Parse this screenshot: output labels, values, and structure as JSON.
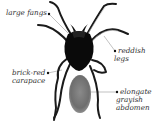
{
  "figure": {
    "labels": [
      {
        "id": "fangs",
        "lines": [
          "large fangs"
        ]
      },
      {
        "id": "legs",
        "lines": [
          "reddish",
          "legs"
        ]
      },
      {
        "id": "carapace",
        "lines": [
          "brick-red",
          "carapace"
        ]
      },
      {
        "id": "abdomen",
        "lines": [
          "elongate",
          "grayish",
          "abdomen"
        ]
      }
    ]
  },
  "colors": {
    "background": "#ffffff",
    "body": "#0a0a0a",
    "abdomen": "#7a7a7a",
    "leader_line": "#888888",
    "text": "#333333"
  }
}
